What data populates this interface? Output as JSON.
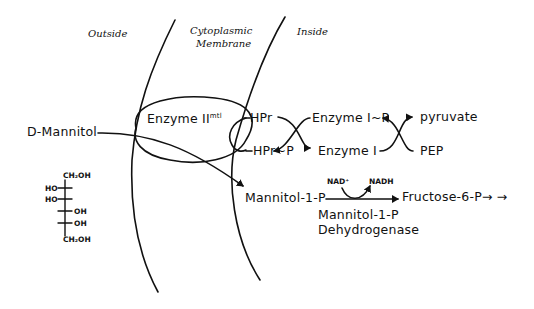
{
  "regions": {
    "outside": "Outside",
    "membrane_line1": "Cytoplasmic",
    "membrane_line2": "Membrane",
    "inside": "Inside"
  },
  "transporter": {
    "name": "Enzyme II",
    "superscript": "mtl"
  },
  "substrate": {
    "name": "D-Mannitol",
    "structure": {
      "top": "CH₂OH",
      "rows": [
        "HO",
        "HO",
        "OH",
        "OH"
      ],
      "bottom": "CH₂OH"
    }
  },
  "phosphorelay": {
    "hpr": "HPr",
    "hpr_p": "HPr~P",
    "enzyme_i_p": "Enzyme I~P",
    "enzyme_i": "Enzyme I",
    "pyruvate": "pyruvate",
    "pep": "PEP"
  },
  "pathway": {
    "product": "Mannitol-1-P",
    "cofactor_in": "NAD⁺",
    "cofactor_out": "NADH",
    "next_product": "Fructose-6-P",
    "continuation": "→ →",
    "enzyme_line1": "Mannitol-1-P",
    "enzyme_line2": "Dehydrogenase"
  },
  "colors": {
    "ink": "#111111",
    "background": "#ffffff"
  }
}
